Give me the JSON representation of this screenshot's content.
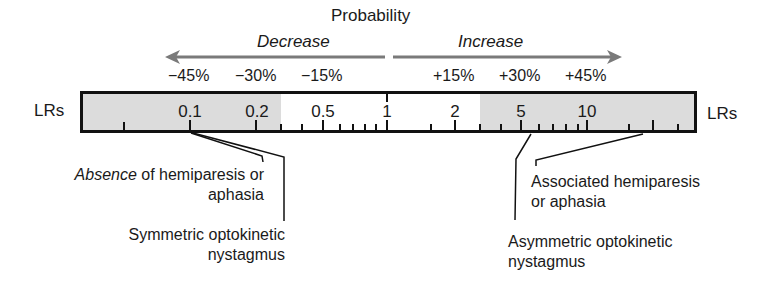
{
  "header": {
    "title": "Probability",
    "decrease_label": "Decrease",
    "increase_label": "Increase"
  },
  "percent_labels": {
    "decrease": [
      "−45%",
      "−30%",
      "−15%"
    ],
    "increase": [
      "+15%",
      "+30%",
      "+45%"
    ]
  },
  "scale": {
    "left_label": "LRs",
    "right_label": "LRs",
    "values": [
      "0.1",
      "0.2",
      "0.5",
      "1",
      "2",
      "5",
      "10"
    ],
    "shade_color": "#dcdcdc",
    "border_color": "#111111"
  },
  "findings": {
    "absence_hemiparesis": {
      "italic_word": "Absence",
      "rest_line1": " of hemiparesis or",
      "line2": "aphasia",
      "lr": "0.1"
    },
    "symmetric_okn": {
      "line1": "Symmetric optokinetic",
      "line2": "nystagmus",
      "lr": "0.1"
    },
    "associated_hemiparesis": {
      "line1": "Associated hemiparesis",
      "line2": "or aphasia",
      "lr": "~15"
    },
    "asymmetric_okn": {
      "line1": "Asymmetric optokinetic",
      "line2": "nystagmus",
      "lr": "~6"
    }
  },
  "colors": {
    "arrow": "#7a7a7a",
    "text": "#1a1a1a"
  }
}
